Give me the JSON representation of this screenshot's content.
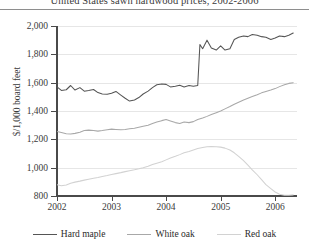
{
  "chart_data": {
    "type": "line",
    "title": "United States sawn hardwood prices, 2002-2006",
    "xlabel": "",
    "ylabel": "$/1,000 board feet",
    "ylim": [
      800,
      2000
    ],
    "ytick_labels": [
      "2,000",
      "1,800",
      "1,600",
      "1,400",
      "1,200",
      "1,000",
      "800"
    ],
    "ytick_values": [
      2000,
      1800,
      1600,
      1400,
      1200,
      1000,
      800
    ],
    "xlim": [
      2002,
      2006.4
    ],
    "xtick_labels": [
      "2002",
      "2003",
      "2004",
      "2005",
      "2006"
    ],
    "xtick_values": [
      2002,
      2003,
      2004,
      2005,
      2006
    ],
    "grid": true,
    "legend_position": "bottom",
    "series": [
      {
        "name": "Hard maple",
        "color": "#555555",
        "x": [
          2002.0,
          2002.08,
          2002.17,
          2002.25,
          2002.33,
          2002.42,
          2002.5,
          2002.58,
          2002.67,
          2002.75,
          2002.83,
          2002.92,
          2003.0,
          2003.08,
          2003.17,
          2003.25,
          2003.33,
          2003.42,
          2003.5,
          2003.58,
          2003.67,
          2003.75,
          2003.83,
          2003.92,
          2004.0,
          2004.08,
          2004.17,
          2004.25,
          2004.33,
          2004.42,
          2004.5,
          2004.58,
          2004.62,
          2004.67,
          2004.75,
          2004.83,
          2004.92,
          2005.0,
          2005.08,
          2005.17,
          2005.25,
          2005.33,
          2005.42,
          2005.5,
          2005.58,
          2005.67,
          2005.75,
          2005.83,
          2005.92,
          2006.0,
          2006.08,
          2006.17,
          2006.25,
          2006.33
        ],
        "values": [
          1570,
          1545,
          1550,
          1580,
          1548,
          1565,
          1540,
          1545,
          1552,
          1530,
          1520,
          1518,
          1525,
          1538,
          1512,
          1490,
          1470,
          1478,
          1495,
          1520,
          1540,
          1565,
          1585,
          1590,
          1588,
          1570,
          1575,
          1582,
          1570,
          1580,
          1575,
          1580,
          1870,
          1840,
          1900,
          1845,
          1830,
          1860,
          1830,
          1840,
          1905,
          1920,
          1930,
          1925,
          1940,
          1935,
          1925,
          1920,
          1905,
          1915,
          1930,
          1925,
          1935,
          1950
        ]
      },
      {
        "name": "White oak",
        "color": "#a8a8a8",
        "x": [
          2002.0,
          2002.08,
          2002.17,
          2002.25,
          2002.33,
          2002.42,
          2002.5,
          2002.58,
          2002.67,
          2002.75,
          2002.83,
          2002.92,
          2003.0,
          2003.08,
          2003.17,
          2003.25,
          2003.33,
          2003.42,
          2003.5,
          2003.58,
          2003.67,
          2003.75,
          2003.83,
          2003.92,
          2004.0,
          2004.08,
          2004.17,
          2004.25,
          2004.33,
          2004.42,
          2004.5,
          2004.58,
          2004.67,
          2004.75,
          2004.83,
          2004.92,
          2005.0,
          2005.08,
          2005.17,
          2005.25,
          2005.33,
          2005.42,
          2005.5,
          2005.58,
          2005.67,
          2005.75,
          2005.83,
          2005.92,
          2006.0,
          2006.08,
          2006.17,
          2006.25,
          2006.33
        ],
        "values": [
          1255,
          1248,
          1240,
          1238,
          1242,
          1250,
          1262,
          1265,
          1262,
          1258,
          1262,
          1268,
          1272,
          1270,
          1268,
          1270,
          1275,
          1278,
          1285,
          1292,
          1300,
          1312,
          1322,
          1332,
          1340,
          1330,
          1318,
          1312,
          1322,
          1318,
          1325,
          1340,
          1350,
          1362,
          1375,
          1388,
          1400,
          1415,
          1432,
          1448,
          1462,
          1478,
          1490,
          1502,
          1515,
          1528,
          1538,
          1548,
          1558,
          1572,
          1585,
          1595,
          1600
        ]
      },
      {
        "name": "Red oak",
        "color": "#d2d2d2",
        "x": [
          2002.0,
          2002.08,
          2002.17,
          2002.25,
          2002.33,
          2002.42,
          2002.5,
          2002.58,
          2002.67,
          2002.75,
          2002.83,
          2002.92,
          2003.0,
          2003.08,
          2003.17,
          2003.25,
          2003.33,
          2003.42,
          2003.5,
          2003.58,
          2003.67,
          2003.75,
          2003.83,
          2003.92,
          2004.0,
          2004.08,
          2004.17,
          2004.25,
          2004.33,
          2004.42,
          2004.5,
          2004.58,
          2004.67,
          2004.75,
          2004.83,
          2004.92,
          2005.0,
          2005.08,
          2005.17,
          2005.25,
          2005.33,
          2005.42,
          2005.5,
          2005.58,
          2005.67,
          2005.75,
          2005.83,
          2005.92,
          2006.0,
          2006.08,
          2006.17,
          2006.25,
          2006.33
        ],
        "values": [
          880,
          872,
          878,
          890,
          898,
          905,
          912,
          918,
          925,
          930,
          938,
          945,
          952,
          958,
          965,
          972,
          978,
          985,
          992,
          1000,
          1010,
          1022,
          1032,
          1042,
          1055,
          1068,
          1080,
          1092,
          1105,
          1115,
          1125,
          1135,
          1142,
          1148,
          1150,
          1148,
          1145,
          1138,
          1125,
          1105,
          1080,
          1050,
          1018,
          985,
          950,
          915,
          880,
          852,
          828,
          812,
          805,
          805,
          808
        ]
      }
    ]
  },
  "legend": {
    "items": [
      {
        "label": "Hard maple",
        "color": "#555555"
      },
      {
        "label": "White oak",
        "color": "#a8a8a8"
      },
      {
        "label": "Red oak",
        "color": "#d2d2d2"
      }
    ]
  }
}
